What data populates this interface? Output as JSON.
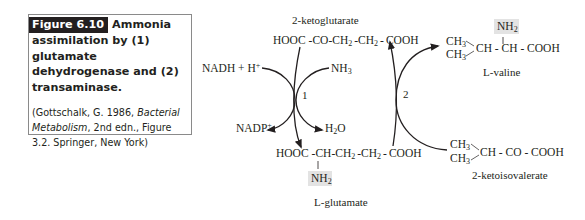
{
  "caption": {
    "figure_label": "Figure 6.10",
    "title_first": "Ammonia",
    "title_rest": "assimilation by (1) glutamate dehydrogenase and (2) transaminase.",
    "ref_prefix": "(Gottschalk, G. 1986, ",
    "ref_italic_1": "Bacterial Metabolism",
    "ref_suffix": ", 2nd edn., Figure 3.2. Springer, New York)"
  },
  "diagram": {
    "compounds": {
      "ketoglutarate": {
        "name": "2-ketoglutarate",
        "formula_parts": [
          "HOOC",
          "-",
          "CO",
          "-",
          "CH",
          "2",
          "-CH",
          "2",
          "-",
          "COOH"
        ]
      },
      "glutamate": {
        "name": "L-glutamate",
        "formula_parts": [
          "HOOC",
          "-",
          "CH",
          "-",
          "CH",
          "2",
          "-CH",
          "2",
          "-",
          "COOH"
        ],
        "amino": "NH",
        "amino_sub": "2"
      },
      "valine": {
        "name": "L-valine",
        "ch3_top": "CH",
        "ch3_bottom": "CH",
        "sub": "3",
        "backbone": "CH - CH - COOH",
        "amino": "NH",
        "amino_sub": "2"
      },
      "ketoisovalerate": {
        "name": "2-ketoisovalerate",
        "ch3_top": "CH",
        "ch3_bottom": "CH",
        "sub": "3",
        "backbone": "CH - CO - COOH"
      }
    },
    "reaction1": {
      "number": "1",
      "inputs": [
        "NADH + H",
        "NH"
      ],
      "input_superscript": "+",
      "nh3_sub": "3",
      "outputs": [
        "NADP",
        "H"
      ],
      "nadp_superscript": "+",
      "water_sub": "2",
      "water_o": "O"
    },
    "reaction2": {
      "number": "2"
    },
    "highlight_color": "#e3e3e3",
    "line_color": "#231f20"
  }
}
